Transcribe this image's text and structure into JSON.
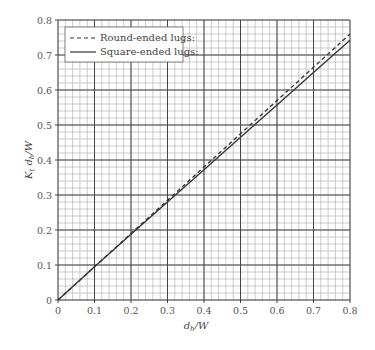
{
  "chart_data": {
    "type": "line",
    "title": "",
    "xlabel": "d_h/W",
    "ylabel": "K_t d_h/W",
    "xlim": [
      0,
      0.8
    ],
    "ylim": [
      0,
      0.8
    ],
    "x_ticks": [
      "0",
      "0.1",
      "0.2",
      "0.3",
      "0.4",
      "0.5",
      "0.6",
      "0.7",
      "0.8"
    ],
    "y_ticks": [
      "0",
      "0.1",
      "0.2",
      "0.3",
      "0.4",
      "0.5",
      "0.6",
      "0.7",
      "0.8"
    ],
    "grid": {
      "major": true,
      "minor": true,
      "minor_per_major": 5
    },
    "legend_position": "upper-left",
    "series": [
      {
        "name": "Round-ended lugs:",
        "style": "dashed",
        "x": [
          0,
          0.1,
          0.2,
          0.3,
          0.4,
          0.5,
          0.6,
          0.7,
          0.8
        ],
        "y": [
          0,
          0.095,
          0.19,
          0.285,
          0.38,
          0.475,
          0.57,
          0.665,
          0.76
        ]
      },
      {
        "name": "Square-ended lugs:",
        "style": "solid",
        "x": [
          0,
          0.1,
          0.2,
          0.3,
          0.4,
          0.5,
          0.6,
          0.7,
          0.8
        ],
        "y": [
          0,
          0.095,
          0.188,
          0.28,
          0.372,
          0.465,
          0.557,
          0.65,
          0.742
        ]
      }
    ]
  },
  "labels": {
    "xlabel_main": "d",
    "xlabel_sub": "h",
    "xlabel_tail": "/W",
    "ylabel_main": "K",
    "ylabel_sub": "t",
    "ylabel_mid": " d",
    "ylabel_sub2": "h",
    "ylabel_tail": "/W"
  },
  "colors": {
    "minor_grid": "#aaaaaa",
    "major_grid": "#444444",
    "line": "#333333"
  }
}
